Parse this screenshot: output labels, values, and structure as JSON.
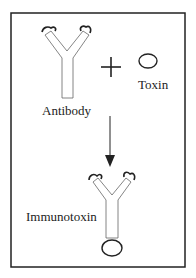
{
  "diagram": {
    "labels": {
      "antibody": "Antibody",
      "toxin": "Toxin",
      "immunotoxin": "Immunotoxin"
    },
    "operator": "+",
    "colors": {
      "stroke": "#222222",
      "background": "#ffffff"
    }
  }
}
